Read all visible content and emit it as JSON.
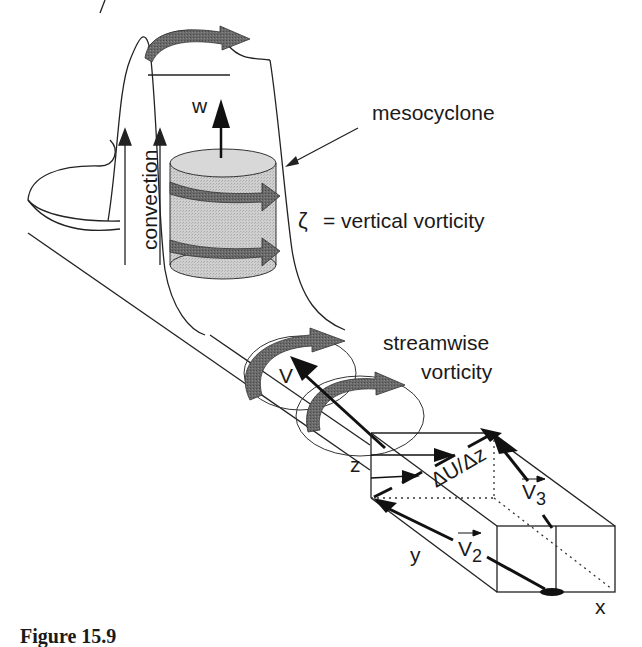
{
  "figure": {
    "caption": "Figure 15.9",
    "labels": {
      "mesocyclone": "mesocyclone",
      "vertical_vorticity_symbol": "ζ",
      "vertical_vorticity_text": "= vertical vorticity",
      "convection": "convection",
      "w": "w",
      "streamwise_line1": "streamwise",
      "streamwise_line2": "vorticity",
      "V": "V",
      "z": "z",
      "shear": "ΔU/Δz",
      "V3_base": "V",
      "V3_sub": "3",
      "V2_base": "V",
      "V2_sub": "2",
      "y": "y",
      "x": "x"
    },
    "colors": {
      "line": "#222222",
      "cylinder_fill": "#c8c8c8",
      "cylinder_top": "#d4d4d4",
      "rotation_arrow": "#5a5a5a",
      "vector": "#111111"
    }
  }
}
